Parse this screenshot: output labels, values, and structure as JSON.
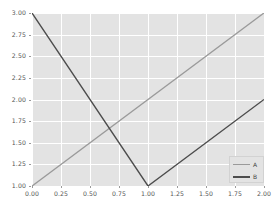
{
  "figure": {
    "background_color": "#ffffff",
    "axes_background_color": "#e3e3e3",
    "grid_color": "#ffffff"
  },
  "chart_data": {
    "type": "line",
    "title": "",
    "xlabel": "",
    "ylabel": "",
    "xlim": [
      0.0,
      2.0
    ],
    "ylim": [
      1.0,
      3.0
    ],
    "grid": true,
    "legend_position": "lower right",
    "xticks": [
      0.0,
      0.25,
      0.5,
      0.75,
      1.0,
      1.25,
      1.5,
      1.75,
      2.0
    ],
    "xtick_labels": [
      "0.00",
      "0.25",
      "0.50",
      "0.75",
      "1.00",
      "1.25",
      "1.50",
      "1.75",
      "2.00"
    ],
    "yticks": [
      1.0,
      1.25,
      1.5,
      1.75,
      2.0,
      2.25,
      2.5,
      2.75,
      3.0
    ],
    "ytick_labels": [
      "1.00",
      "1.25",
      "1.50",
      "1.75",
      "2.00",
      "2.25",
      "2.50",
      "2.75",
      "3.00"
    ],
    "series": [
      {
        "name": "A",
        "color": "#9a9a9a",
        "x": [
          0.0,
          1.0,
          2.0
        ],
        "values": [
          1.0,
          2.0,
          3.0
        ]
      },
      {
        "name": "B",
        "color": "#4d4d4d",
        "x": [
          0.0,
          1.0,
          2.0
        ],
        "values": [
          3.0,
          1.0,
          2.0
        ]
      }
    ],
    "legend_entries": [
      {
        "label": "A",
        "color": "#9a9a9a"
      },
      {
        "label": "B",
        "color": "#4d4d4d"
      }
    ]
  }
}
